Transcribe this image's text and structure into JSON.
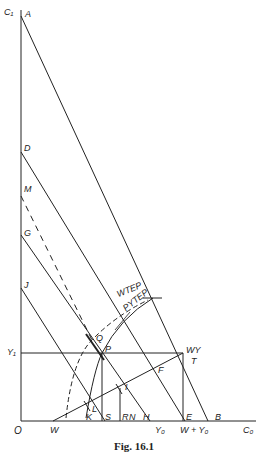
{
  "figure": {
    "caption": "Fig. 16.1",
    "axes": {
      "y_axis": "C₁",
      "x_axis": "C₀",
      "origin": "O"
    },
    "points": {
      "A": "A",
      "D": "D",
      "M": "M",
      "G": "G",
      "J": "J",
      "Y1": "Y₁",
      "Q": "Q",
      "P": "P",
      "WY": "WY",
      "T": "T",
      "F": "F",
      "I": "I",
      "L": "L",
      "K": "K",
      "S": "S",
      "R": "R",
      "N": "N",
      "H": "H",
      "E": "E",
      "B": "B",
      "W": "W"
    },
    "axis_ticks": {
      "Y0": "Y₀",
      "W_plus_Y0": "W + Y₀"
    },
    "curves": {
      "WTEP": "WTEP",
      "PYTEP": "PYTEP"
    },
    "colors": {
      "ink": "#222222",
      "background": "#ffffff"
    }
  }
}
